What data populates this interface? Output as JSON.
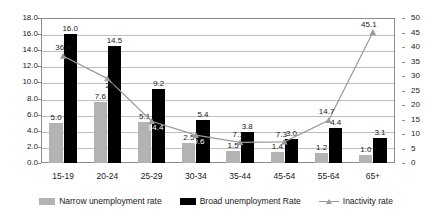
{
  "chart_data": {
    "type": "bar",
    "title": "",
    "subtitle": "",
    "xlabel": "",
    "ylabel": "",
    "categories": [
      "15-19",
      "20-24",
      "25-29",
      "30-34",
      "35-44",
      "45-54",
      "55-64",
      "65+"
    ],
    "series": [
      {
        "name": "Narrow unemployment rate",
        "type": "bar",
        "axis": "left",
        "color": "#b3b3b3",
        "values": [
          5.0,
          7.6,
          5.1,
          2.5,
          1.5,
          1.4,
          1.2,
          1.0
        ],
        "labels": [
          "5.0",
          "7.6",
          "5.1",
          "2.5",
          "1.5",
          "1.4",
          "1.2",
          "1.0"
        ]
      },
      {
        "name": "Broad unemployment Rate",
        "type": "bar",
        "axis": "left",
        "color": "#000000",
        "values": [
          16.0,
          14.5,
          9.2,
          5.4,
          3.8,
          3.0,
          4.4,
          3.1
        ],
        "labels": [
          "16.0",
          "14.5",
          "9.2",
          "5.4",
          "3.8",
          "3.0",
          "4.4",
          "3.1"
        ]
      },
      {
        "name": "Inactivity rate",
        "type": "line",
        "axis": "right",
        "color": "#9a9a9a",
        "marker": "triangle",
        "values": [
          36.9,
          29.1,
          14.4,
          9.6,
          7.1,
          7.3,
          14.7,
          45.1
        ],
        "labels": [
          "36.9",
          "29.1",
          "14.4",
          "9.6",
          "7.1",
          "7.3",
          "14.7",
          "45.1"
        ]
      }
    ],
    "left_axis": {
      "min": 0.0,
      "max": 18.0,
      "step": 2.0,
      "ticks": [
        "0.0",
        "2.0",
        "4.0",
        "6.0",
        "8.0",
        "10.0",
        "12.0",
        "14.0",
        "16.0",
        "18.0"
      ]
    },
    "right_axis": {
      "min": 0,
      "max": 50,
      "step": 5,
      "ticks": [
        "0",
        "5",
        "10",
        "15",
        "20",
        "25",
        "30",
        "35",
        "40",
        "45",
        "50"
      ]
    },
    "grid": true,
    "legend_position": "bottom",
    "legend": [
      "Narrow unemployment rate",
      "Broad unemployment Rate",
      "Inactivity rate"
    ]
  }
}
